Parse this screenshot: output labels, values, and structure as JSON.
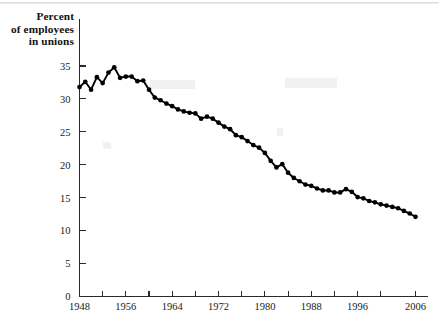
{
  "figure": {
    "y_axis_title_lines": [
      "Percent",
      "of employees",
      "in unions"
    ],
    "y_axis_title": "Percent of employees in unions"
  },
  "chart_data": {
    "type": "line",
    "title": "",
    "subtitle": "",
    "xlabel": "",
    "ylabel": "Percent of employees in unions",
    "xlim": [
      1948,
      2006
    ],
    "ylim": [
      0,
      37
    ],
    "grid": false,
    "legend": "none",
    "markers": "filled-circle",
    "y_ticks": [
      0,
      5,
      10,
      15,
      20,
      25,
      30,
      35
    ],
    "y_tick_labels": [
      "0",
      "5",
      "10",
      "15",
      "20",
      "25",
      "30",
      "35"
    ],
    "x_ticks": [
      1948,
      1952,
      1956,
      1960,
      1964,
      1968,
      1972,
      1976,
      1980,
      1984,
      1988,
      1992,
      1996,
      2000,
      2006
    ],
    "x_tick_labels": [
      "1948",
      "",
      "1956",
      "",
      "1964",
      "",
      "1972",
      "",
      "1980",
      "",
      "1988",
      "",
      "1996",
      "",
      "2006"
    ],
    "x_labeled_ticks": [
      1948,
      1956,
      1964,
      1972,
      1980,
      1988,
      1996,
      2006
    ],
    "series": [
      {
        "name": "Percent of employees in unions",
        "color": "#000000",
        "x": [
          1948,
          1949,
          1950,
          1951,
          1952,
          1953,
          1954,
          1955,
          1956,
          1957,
          1958,
          1959,
          1960,
          1961,
          1962,
          1963,
          1964,
          1965,
          1966,
          1967,
          1968,
          1969,
          1970,
          1971,
          1972,
          1973,
          1974,
          1975,
          1976,
          1977,
          1978,
          1979,
          1980,
          1981,
          1982,
          1983,
          1984,
          1985,
          1986,
          1987,
          1988,
          1989,
          1990,
          1991,
          1992,
          1993,
          1994,
          1995,
          1996,
          1997,
          1998,
          1999,
          2000,
          2001,
          2002,
          2003,
          2004,
          2005,
          2006
        ],
        "values": [
          31.8,
          32.6,
          31.4,
          33.3,
          32.4,
          34.0,
          34.8,
          33.2,
          33.4,
          33.4,
          32.7,
          32.8,
          31.4,
          30.2,
          29.8,
          29.3,
          28.9,
          28.4,
          28.1,
          27.9,
          27.8,
          27.0,
          27.3,
          27.0,
          26.4,
          25.8,
          25.4,
          24.5,
          24.2,
          23.6,
          23.0,
          22.6,
          21.8,
          20.6,
          19.6,
          20.1,
          18.8,
          18.0,
          17.5,
          17.0,
          16.8,
          16.4,
          16.1,
          16.1,
          15.8,
          15.8,
          16.3,
          15.9,
          15.1,
          14.9,
          14.5,
          14.3,
          14.0,
          13.8,
          13.6,
          13.4,
          13.0,
          12.6,
          12.1
        ]
      }
    ]
  }
}
